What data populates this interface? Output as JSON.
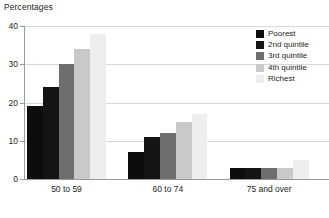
{
  "chart_data": {
    "type": "bar",
    "title": "Percentages",
    "xlabel": "",
    "ylabel": "",
    "categories": [
      "50 to 59",
      "60 to 74",
      "75 and over"
    ],
    "series": [
      {
        "name": "Poorest",
        "color": "#0d0d0d",
        "values": [
          19,
          7,
          3
        ]
      },
      {
        "name": "2nd quintile",
        "color": "#141414",
        "values": [
          24,
          11,
          3
        ]
      },
      {
        "name": "3rd quintile",
        "color": "#6e6e6e",
        "values": [
          30,
          12,
          3
        ]
      },
      {
        "name": "4th quintile",
        "color": "#c9c9c9",
        "values": [
          34,
          15,
          3
        ]
      },
      {
        "name": "Richest",
        "color": "#eeeeee",
        "values": [
          38,
          17,
          5
        ]
      }
    ],
    "ylim": [
      0,
      40
    ],
    "yticks": [
      0,
      10,
      20,
      30,
      40
    ],
    "ytick_labels": [
      "0",
      "10",
      "20",
      "30",
      "40"
    ],
    "grid": true,
    "gridline_color": "#d8d8d8",
    "axis_color": "#9a9a9a",
    "legend_position": "top-right",
    "background": "#ffffff",
    "text_color": "#231f20"
  }
}
